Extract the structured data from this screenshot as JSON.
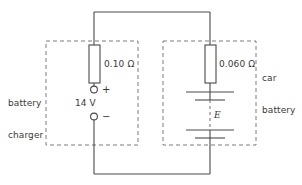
{
  "figure": {
    "type": "circuit-diagram",
    "stroke_color": "#4a4a4a",
    "dashed_color": "#6e6e6e",
    "text_color": "#3a3a3a",
    "background": "#ffffff"
  },
  "left_block": {
    "name": "battery charger",
    "label_line1": "battery",
    "label_line2": "charger",
    "resistor": {
      "label": "0.10 Ω",
      "value": "0.10",
      "unit": "Ω"
    },
    "source": {
      "label": "14 V",
      "value": "14",
      "unit": "V",
      "positive_terminal": "+",
      "negative_terminal": "−"
    }
  },
  "right_block": {
    "name": "car battery",
    "label_line1": "car",
    "label_line2": "battery",
    "resistor": {
      "label": "0.060 Ω",
      "value": "0.060",
      "unit": "Ω"
    },
    "emf": {
      "label": "E",
      "symbol": "E"
    }
  }
}
